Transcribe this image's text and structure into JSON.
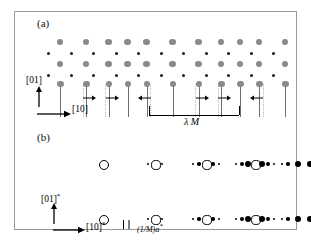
{
  "figure": {
    "panel_a": {
      "label": "(a)",
      "axis_vertical": "[01]",
      "axis_horizontal": "[10]",
      "modulation_label": "λ M",
      "lattice": {
        "big_dot_color": "#8a8a8a",
        "small_dot_color": "#1a1a1a",
        "stem_color": "#6f6f6f",
        "columns": 11,
        "rows": 4,
        "col_spacing": 22.5,
        "first_col_x": 45,
        "row_y": [
          30,
          41,
          52,
          63
        ],
        "stem_row_y": 72,
        "stem_length": 33,
        "big_radius": 3.1,
        "small_radius": 1.5,
        "displacements": [
          0,
          1,
          1,
          0,
          -1,
          0,
          1,
          1,
          0,
          -1,
          0
        ],
        "displacement_px": 3.5
      },
      "bracket": {
        "x_start": 134,
        "x_end": 224,
        "y": 103,
        "tick_height": 9
      }
    },
    "panel_b": {
      "label": "(b)",
      "axis_vertical": "[01]*",
      "axis_horizontal": "[10]*",
      "spacing_label": "(1/M)a*",
      "rows": [
        {
          "y": 152,
          "groups": [
            {
              "center_x": 88,
              "main_r": 4.0,
              "satellites": []
            },
            {
              "center_x": 140,
              "main_r": 3.6,
              "satellites": [
                {
                  "dx": -7,
                  "r": 1.1
                },
                {
                  "dx": 7,
                  "r": 1.1
                }
              ]
            },
            {
              "center_x": 191,
              "main_r": 3.6,
              "satellites": [
                {
                  "dx": -13,
                  "r": 1.3
                },
                {
                  "dx": -7,
                  "r": 1.8
                },
                {
                  "dx": 7,
                  "r": 1.8
                },
                {
                  "dx": 13,
                  "r": 1.3
                }
              ]
            },
            {
              "center_x": 240,
              "main_r": 3.6,
              "satellites": [
                {
                  "dx": -19,
                  "r": 1.3
                },
                {
                  "dx": -13,
                  "r": 1.9
                },
                {
                  "dx": -7,
                  "r": 3.1
                },
                {
                  "dx": 7,
                  "r": 3.1
                },
                {
                  "dx": 13,
                  "r": 1.9
                },
                {
                  "dx": 19,
                  "r": 1.3
                }
              ]
            },
            {
              "center_x": 283,
              "main_r": 3.4,
              "filled": true,
              "satellites": [
                {
                  "dx": -16,
                  "r": 1.4
                },
                {
                  "dx": -10,
                  "r": 1.8
                },
                {
                  "dx": 12,
                  "r": 3.4
                },
                {
                  "dx": 20,
                  "r": 1.7
                },
                {
                  "dx": 26,
                  "r": 1.4
                }
              ]
            }
          ]
        },
        {
          "y": 207,
          "groups": [
            {
              "center_x": 88,
              "main_r": 4.0,
              "satellites": []
            },
            {
              "center_x": 140,
              "main_r": 3.6,
              "satellites": [
                {
                  "dx": -7,
                  "r": 1.1
                },
                {
                  "dx": 7,
                  "r": 1.1
                }
              ]
            },
            {
              "center_x": 191,
              "main_r": 3.6,
              "satellites": [
                {
                  "dx": -13,
                  "r": 1.3
                },
                {
                  "dx": -7,
                  "r": 1.8
                },
                {
                  "dx": 7,
                  "r": 1.8
                },
                {
                  "dx": 13,
                  "r": 1.3
                }
              ]
            },
            {
              "center_x": 240,
              "main_r": 3.6,
              "satellites": [
                {
                  "dx": -19,
                  "r": 1.3
                },
                {
                  "dx": -13,
                  "r": 1.9
                },
                {
                  "dx": -7,
                  "r": 3.1
                },
                {
                  "dx": 7,
                  "r": 3.1
                },
                {
                  "dx": 13,
                  "r": 1.9
                },
                {
                  "dx": 19,
                  "r": 1.3
                }
              ]
            },
            {
              "center_x": 283,
              "main_r": 3.4,
              "filled": true,
              "satellites": [
                {
                  "dx": -16,
                  "r": 1.4
                },
                {
                  "dx": -10,
                  "r": 1.8
                },
                {
                  "dx": 12,
                  "r": 3.4
                },
                {
                  "dx": 20,
                  "r": 1.7
                },
                {
                  "dx": 26,
                  "r": 1.4
                }
              ]
            }
          ]
        }
      ]
    }
  }
}
